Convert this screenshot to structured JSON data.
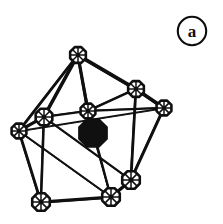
{
  "figure": {
    "panel_label": "a",
    "label_style": "circled",
    "background_color": "#ffffff",
    "ink_color": "#101010"
  },
  "chart_data": {
    "type": "diagram",
    "title": "a",
    "xlabel": "",
    "ylabel": "",
    "canvas": {
      "width": 223,
      "height": 224
    },
    "ink_color": "#101010",
    "vertex_style": {
      "open": "octagonal outline node with internal cross lines",
      "filled": "solid black octagon"
    },
    "atoms": [
      {
        "id": "V1",
        "label": "",
        "x": 78,
        "y": 55,
        "r": 8.5,
        "fill": "open",
        "name": "apex-top"
      },
      {
        "id": "V2",
        "label": "",
        "x": 136,
        "y": 89,
        "r": 8.5,
        "fill": "open",
        "name": "upper-right"
      },
      {
        "id": "V3",
        "label": "",
        "x": 164,
        "y": 108,
        "r": 8.0,
        "fill": "open",
        "name": "far-right"
      },
      {
        "id": "V4",
        "label": "",
        "x": 88,
        "y": 111,
        "r": 8.0,
        "fill": "open",
        "name": "centre-upper"
      },
      {
        "id": "V5",
        "label": "",
        "x": 44,
        "y": 117,
        "r": 9.0,
        "fill": "open",
        "name": "mid-left"
      },
      {
        "id": "V6",
        "label": "",
        "x": 19,
        "y": 131,
        "r": 8.0,
        "fill": "open",
        "name": "far-left"
      },
      {
        "id": "V7",
        "label": "",
        "x": 41,
        "y": 202,
        "r": 9.5,
        "fill": "open",
        "name": "bottom-left"
      },
      {
        "id": "V8",
        "label": "",
        "x": 111,
        "y": 197,
        "r": 9.5,
        "fill": "open",
        "name": "bottom-centre"
      },
      {
        "id": "V9",
        "label": "",
        "x": 131,
        "y": 180,
        "r": 9.5,
        "fill": "open",
        "name": "bottom-right"
      },
      {
        "id": "C1",
        "label": "",
        "x": 93,
        "y": 133,
        "r": 15.0,
        "fill": "filled",
        "name": "interstitial-centre"
      }
    ],
    "bonds": [
      {
        "from": "V1",
        "to": "V2",
        "weight": 3.6
      },
      {
        "from": "V1",
        "to": "V4",
        "weight": 3.0
      },
      {
        "from": "V1",
        "to": "V5",
        "weight": 3.2
      },
      {
        "from": "V1",
        "to": "V6",
        "weight": 2.6
      },
      {
        "from": "V2",
        "to": "V3",
        "weight": 3.4
      },
      {
        "from": "V2",
        "to": "V4",
        "weight": 2.4
      },
      {
        "from": "V2",
        "to": "V9",
        "weight": 2.6
      },
      {
        "from": "V3",
        "to": "V4",
        "weight": 1.9
      },
      {
        "from": "V3",
        "to": "V9",
        "weight": 2.8
      },
      {
        "from": "V4",
        "to": "V5",
        "weight": 2.2
      },
      {
        "from": "V4",
        "to": "V8",
        "weight": 2.0
      },
      {
        "from": "V5",
        "to": "V6",
        "weight": 3.0
      },
      {
        "from": "V5",
        "to": "V7",
        "weight": 2.4
      },
      {
        "from": "V5",
        "to": "V9",
        "weight": 2.0
      },
      {
        "from": "V6",
        "to": "V7",
        "weight": 2.6
      },
      {
        "from": "V6",
        "to": "V3",
        "weight": 1.7
      },
      {
        "from": "V7",
        "to": "V8",
        "weight": 3.2
      },
      {
        "from": "V8",
        "to": "V9",
        "weight": 3.0
      },
      {
        "from": "V6",
        "to": "V8",
        "weight": 1.8
      },
      {
        "from": "V1",
        "to": "C1",
        "weight": 1.6
      },
      {
        "from": "C1",
        "to": "V8",
        "weight": 1.6
      }
    ],
    "annotations": [
      {
        "text": "a",
        "x": 192,
        "y": 31,
        "shape": "circle",
        "radius": 16
      }
    ]
  }
}
